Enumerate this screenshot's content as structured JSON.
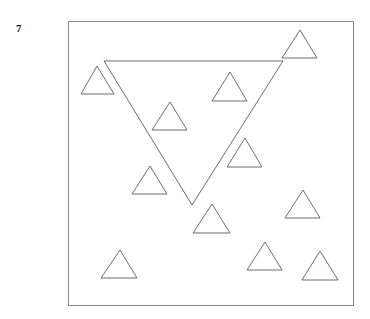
{
  "figure": {
    "label": "7",
    "colors": {
      "background": "#ffffff",
      "frame_stroke": "#8a8a8a",
      "shape_stroke": "#5c5c5c",
      "label_color": "#1b1b1b"
    },
    "frame": {
      "x": 68,
      "y": 21,
      "width": 285,
      "height": 284
    },
    "large_triangle": {
      "name": "large-inverted-triangle",
      "orientation": "inverted",
      "points": "104,61 283,61 192,205"
    },
    "small_triangles": [
      {
        "name": "small-triangle-top-left",
        "orientation": "upright",
        "points": "97,66 114,94 81,94"
      },
      {
        "name": "small-triangle-top-right",
        "orientation": "upright",
        "points": "300,30 317,58 282,58"
      },
      {
        "name": "small-triangle-upper-middle",
        "orientation": "upright",
        "points": "230,72 247,101 212,101"
      },
      {
        "name": "small-triangle-inner-left",
        "orientation": "upright",
        "points": "170,102 187,130 152,130"
      },
      {
        "name": "small-triangle-right-edge",
        "orientation": "upright",
        "points": "245,138 262,167 227,167"
      },
      {
        "name": "small-triangle-lower-left",
        "orientation": "upright",
        "points": "150,166 167,194 132,194"
      },
      {
        "name": "small-triangle-below-apex",
        "orientation": "upright",
        "points": "212,204 230,233 193,233"
      },
      {
        "name": "small-triangle-mid-right",
        "orientation": "upright",
        "points": "303,190 320,218 285,218"
      },
      {
        "name": "small-triangle-bottom-left",
        "orientation": "upright",
        "points": "120,250 137,278 101,278"
      },
      {
        "name": "small-triangle-bottom-middle",
        "orientation": "upright",
        "points": "265,242 282,270 247,270"
      },
      {
        "name": "small-triangle-bottom-right",
        "orientation": "upright",
        "points": "320,251 338,280 302,280"
      }
    ],
    "counts": {
      "large_triangles": 1,
      "small_triangles": 11,
      "total_triangles": 12
    }
  }
}
